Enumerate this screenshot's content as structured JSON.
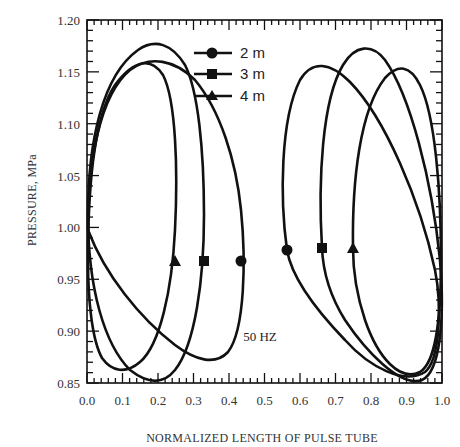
{
  "chart_data": {
    "type": "line",
    "title": "",
    "xlabel": "NORMALIZED LENGTH OF PULSE TUBE",
    "ylabel": "PRESSURE, MPa",
    "xlim": [
      0.0,
      1.0
    ],
    "ylim": [
      0.85,
      1.2
    ],
    "x_ticks": [
      "0.0",
      "0.1",
      "0.2",
      "0.3",
      "0.4",
      "0.5",
      "0.6",
      "0.7",
      "0.8",
      "0.9",
      "1.0"
    ],
    "y_ticks": [
      "1.20",
      "1.15",
      "1.10",
      "1.05",
      "1.00",
      "0.95",
      "0.90",
      "0.85"
    ],
    "grid": false,
    "legend_position": "upper center",
    "annotations": [
      "50 HZ"
    ],
    "series": [
      {
        "name": "2 m",
        "marker": "circle",
        "left_loop": {
          "x_range": [
            0.0,
            0.44
          ],
          "y_range": [
            0.862,
            1.155
          ],
          "marker_point": [
            0.44,
            0.97
          ]
        },
        "right_loop": {
          "x_range": [
            0.55,
            1.0
          ],
          "y_range": [
            0.858,
            1.155
          ],
          "marker_point": [
            0.57,
            0.98
          ]
        }
      },
      {
        "name": "3 m",
        "marker": "square",
        "left_loop": {
          "x_range": [
            0.0,
            0.34
          ],
          "y_range": [
            0.85,
            1.175
          ],
          "marker_point": [
            0.34,
            0.97
          ]
        },
        "right_loop": {
          "x_range": [
            0.66,
            1.0
          ],
          "y_range": [
            0.852,
            1.172
          ],
          "marker_point": [
            0.66,
            0.98
          ]
        }
      },
      {
        "name": "4 m",
        "marker": "triangle",
        "left_loop": {
          "x_range": [
            0.0,
            0.25
          ],
          "y_range": [
            0.865,
            1.155
          ],
          "marker_point": [
            0.25,
            0.97
          ]
        },
        "right_loop": {
          "x_range": [
            0.75,
            1.0
          ],
          "y_range": [
            0.862,
            1.153
          ],
          "marker_point": [
            0.75,
            0.98
          ]
        }
      }
    ]
  },
  "legend": {
    "items": [
      {
        "label": "2 m",
        "marker": "circle"
      },
      {
        "label": "3 m",
        "marker": "square"
      },
      {
        "label": "4 m",
        "marker": "triangle"
      }
    ]
  },
  "annotation": "50 HZ",
  "axes": {
    "xlabel": "NORMALIZED LENGTH OF PULSE TUBE",
    "ylabel": "PRESSURE, MPa",
    "x_ticks": [
      "0.0",
      "0.1",
      "0.2",
      "0.3",
      "0.4",
      "0.5",
      "0.6",
      "0.7",
      "0.8",
      "0.9",
      "1.0"
    ],
    "y_ticks": [
      "1.20",
      "1.15",
      "1.10",
      "1.05",
      "1.00",
      "0.95",
      "0.90",
      "0.85"
    ]
  }
}
